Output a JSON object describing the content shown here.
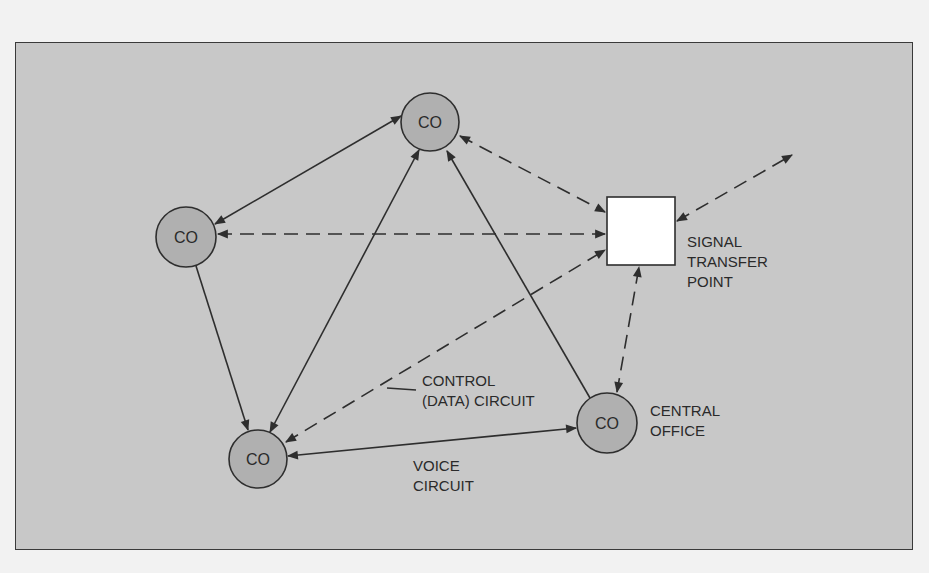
{
  "diagram": {
    "title": "",
    "colors": {
      "page_background": "#f2f2f2",
      "frame_background": "#c8c8c8",
      "node_fill": "#b0b0b0",
      "stp_fill": "#ffffff",
      "stroke": "#2e2e2e",
      "text": "#2a2a2a"
    },
    "nodes": [
      {
        "id": "co_top",
        "type": "central-office",
        "label": "CO",
        "cx": 430,
        "cy": 122,
        "r": 29
      },
      {
        "id": "co_left",
        "type": "central-office",
        "label": "CO",
        "cx": 186,
        "cy": 237,
        "r": 30
      },
      {
        "id": "co_bottom_left",
        "type": "central-office",
        "label": "CO",
        "cx": 258,
        "cy": 459,
        "r": 29
      },
      {
        "id": "co_bottom_right",
        "type": "central-office",
        "label": "CO",
        "cx": 607,
        "cy": 423,
        "r": 30
      },
      {
        "id": "stp",
        "type": "signal-transfer-point",
        "label": "",
        "x": 607,
        "y": 197,
        "w": 68,
        "h": 68
      }
    ],
    "edges": [
      {
        "from": "co_left",
        "to": "co_top",
        "style": "solid",
        "arrows": "both",
        "kind": "voice"
      },
      {
        "from": "co_left",
        "to": "co_bottom_left",
        "style": "solid",
        "arrows": "end",
        "kind": "voice"
      },
      {
        "from": "co_bottom_left",
        "to": "co_top",
        "style": "solid",
        "arrows": "both",
        "kind": "voice"
      },
      {
        "from": "co_bottom_right",
        "to": "co_top",
        "style": "solid",
        "arrows": "end",
        "kind": "voice"
      },
      {
        "from": "co_bottom_left",
        "to": "co_bottom_right",
        "style": "solid",
        "arrows": "both",
        "kind": "voice"
      },
      {
        "from": "co_top",
        "to": "stp",
        "style": "dashed",
        "arrows": "both",
        "kind": "control"
      },
      {
        "from": "co_left",
        "to": "stp",
        "style": "dashed",
        "arrows": "both",
        "kind": "control"
      },
      {
        "from": "co_bottom_left",
        "to": "stp",
        "style": "dashed",
        "arrows": "both",
        "kind": "control"
      },
      {
        "from": "co_bottom_right",
        "to": "stp",
        "style": "dashed",
        "arrows": "both",
        "kind": "control"
      },
      {
        "from": "stp",
        "to": "off_diagram",
        "style": "dashed",
        "arrows": "both",
        "kind": "control"
      }
    ],
    "labels": {
      "node_co": "CO",
      "stp_line1": "SIGNAL",
      "stp_line2": "TRANSFER",
      "stp_line3": "POINT",
      "central_office_line1": "CENTRAL",
      "central_office_line2": "OFFICE",
      "control_line1": "CONTROL",
      "control_line2": "(DATA) CIRCUIT",
      "voice_line1": "VOICE",
      "voice_line2": "CIRCUIT"
    }
  }
}
